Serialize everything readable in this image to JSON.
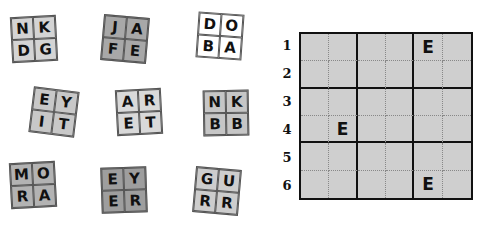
{
  "tiles": [
    {
      "letters": [
        "N",
        "K",
        "D",
        "G"
      ],
      "x": 11,
      "y": 16,
      "rot": -3,
      "color": "#d4d4d4"
    },
    {
      "letters": [
        "J",
        "A",
        "F",
        "E"
      ],
      "x": 102,
      "y": 16,
      "rot": 5,
      "color": "#a8a8a8"
    },
    {
      "letters": [
        "D",
        "O",
        "B",
        "A"
      ],
      "x": 197,
      "y": 13,
      "rot": 4,
      "color": "#ffffff"
    },
    {
      "letters": [
        "E",
        "Y",
        "I",
        "T"
      ],
      "x": 31,
      "y": 89,
      "rot": 7,
      "color": "#c8c8c8"
    },
    {
      "letters": [
        "A",
        "R",
        "E",
        "T"
      ],
      "x": 116,
      "y": 89,
      "rot": -3,
      "color": "#d9d9d9"
    },
    {
      "letters": [
        "N",
        "K",
        "B",
        "B"
      ],
      "x": 203,
      "y": 90,
      "rot": -1,
      "color": "#c6c6c6"
    },
    {
      "letters": [
        "M",
        "O",
        "R",
        "A"
      ],
      "x": 10,
      "y": 162,
      "rot": -3,
      "color": "#b3b3b3"
    },
    {
      "letters": [
        "E",
        "Y",
        "E",
        "R"
      ],
      "x": 101,
      "y": 167,
      "rot": -2,
      "color": "#9e9e9e"
    },
    {
      "letters": [
        "G",
        "U",
        "R",
        "R"
      ],
      "x": 194,
      "y": 168,
      "rot": 5,
      "color": "#cdcdcd"
    }
  ],
  "board": {
    "rows": 6,
    "cols": 6,
    "row_labels": [
      "1",
      "2",
      "3",
      "4",
      "5",
      "6"
    ],
    "cells": [
      [
        "",
        "",
        "",
        "",
        "E",
        ""
      ],
      [
        "",
        "",
        "",
        "",
        "",
        ""
      ],
      [
        "",
        "",
        "",
        "",
        "",
        ""
      ],
      [
        "",
        "E",
        "",
        "",
        "",
        ""
      ],
      [
        "",
        "",
        "",
        "",
        "",
        ""
      ],
      [
        "",
        "",
        "",
        "",
        "E",
        ""
      ]
    ]
  }
}
